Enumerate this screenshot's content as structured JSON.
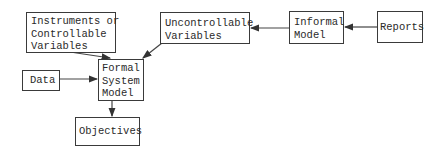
{
  "diagram": {
    "nodes": [
      {
        "id": "instruments",
        "label": "Instruments or\nControllable\nVariables"
      },
      {
        "id": "uncontrollable",
        "label": "Uncontrollable\nVariables"
      },
      {
        "id": "informal",
        "label": "Informal\nModel"
      },
      {
        "id": "reports",
        "label": "Reports"
      },
      {
        "id": "data",
        "label": "Data"
      },
      {
        "id": "formal",
        "label": "Formal\nSystem\nModel"
      },
      {
        "id": "objectives",
        "label": "Objectives"
      }
    ],
    "edges": [
      {
        "from": "reports",
        "to": "informal"
      },
      {
        "from": "informal",
        "to": "uncontrollable"
      },
      {
        "from": "uncontrollable",
        "to": "formal"
      },
      {
        "from": "instruments",
        "to": "formal"
      },
      {
        "from": "data",
        "to": "formal"
      },
      {
        "from": "formal",
        "to": "objectives"
      }
    ]
  }
}
